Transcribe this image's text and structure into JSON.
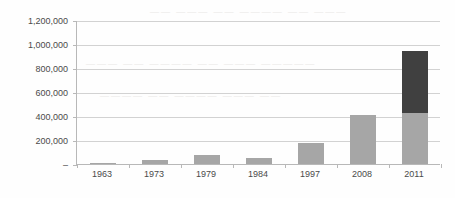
{
  "chart_data": {
    "type": "bar",
    "title": "",
    "subtitle": "",
    "xlabel": "",
    "ylabel": "",
    "stacked": true,
    "grid": true,
    "legend": "none",
    "ylim": [
      0,
      1200000
    ],
    "ytick_values": [
      0,
      200000,
      400000,
      600000,
      800000,
      1000000,
      1200000
    ],
    "ytick_labels": [
      "–",
      "200,000",
      "400,000",
      "600,000",
      "800,000",
      "1,000,000",
      "1,200,000"
    ],
    "categories": [
      "1963",
      "1973",
      "1979",
      "1984",
      "1997",
      "2008",
      "2011"
    ],
    "series": [
      {
        "name": "lower-segment",
        "color": "#a6a6a6",
        "values": [
          12000,
          32000,
          72000,
          48000,
          172000,
          412000,
          424000
        ]
      },
      {
        "name": "upper-segment",
        "color": "#404040",
        "values": [
          0,
          0,
          0,
          0,
          0,
          0,
          516000
        ]
      }
    ],
    "totals": [
      12000,
      32000,
      72000,
      48000,
      172000,
      412000,
      940000
    ],
    "colors": {
      "lower": "#a6a6a6",
      "upper": "#404040",
      "gridline": "#d2d2d2",
      "axis": "#b8b8b8",
      "text": "#4a4a4a",
      "background": "#fefefe"
    }
  },
  "artifacts": {
    "bleed_1": "——— —— ———— —— ——— —————",
    "bleed_2": "———— —— ———— ——— ——",
    "bleed_3": "—— ——— —— ———— —— ———"
  }
}
